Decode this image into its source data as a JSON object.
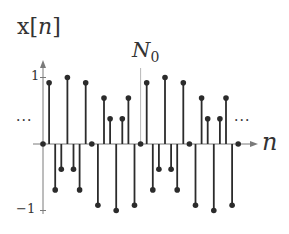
{
  "chart_data": {
    "type": "stem",
    "title": "",
    "ylabel": "x[n]",
    "xlabel": "n",
    "annotations": [
      {
        "text": "N0",
        "at_n": 16,
        "note": "period marker (vertical line)"
      },
      {
        "text": "...",
        "position": "left"
      },
      {
        "text": "...",
        "position": "right"
      }
    ],
    "ytick_labels": [
      "1",
      "-1"
    ],
    "ylim": [
      -1,
      1
    ],
    "period": 16,
    "x": [
      0,
      1,
      2,
      3,
      4,
      5,
      6,
      7,
      8,
      9,
      10,
      11,
      12,
      13,
      14,
      15,
      16,
      17,
      18,
      19,
      20,
      21,
      22,
      23,
      24,
      25,
      26,
      27,
      28,
      29,
      30,
      31,
      32
    ],
    "values": [
      0,
      0.92,
      -0.69,
      -0.38,
      1.0,
      -0.38,
      -0.69,
      0.92,
      0,
      -0.92,
      0.69,
      0.38,
      -1.0,
      0.38,
      0.69,
      -0.92,
      0,
      0.92,
      -0.69,
      -0.38,
      1.0,
      -0.38,
      -0.69,
      0.92,
      0,
      -0.92,
      0.69,
      0.38,
      -1.0,
      0.38,
      0.69,
      -0.92,
      0
    ],
    "grid": false,
    "legend": null
  },
  "labels": {
    "ylabel_prefix": "x[",
    "ylabel_var": "n",
    "ylabel_suffix": "]",
    "n0_main": "N",
    "n0_sub": "0",
    "xlabel": "n",
    "tick_pos": "1",
    "tick_neg": "−1",
    "dots_left": "···",
    "dots_right": "···"
  },
  "style": {
    "stem_color": "#2b2b2b",
    "axis_color": "#7a7a7a",
    "marker_color": "#2b2b2b"
  },
  "layout": {
    "x0": 43,
    "dx": 6.1,
    "y_axis": 144,
    "y_unit": 66.5,
    "y_axis_top": 60,
    "y_axis_bottom": 214,
    "x_axis_end": 258,
    "n0_line_top": 68
  }
}
